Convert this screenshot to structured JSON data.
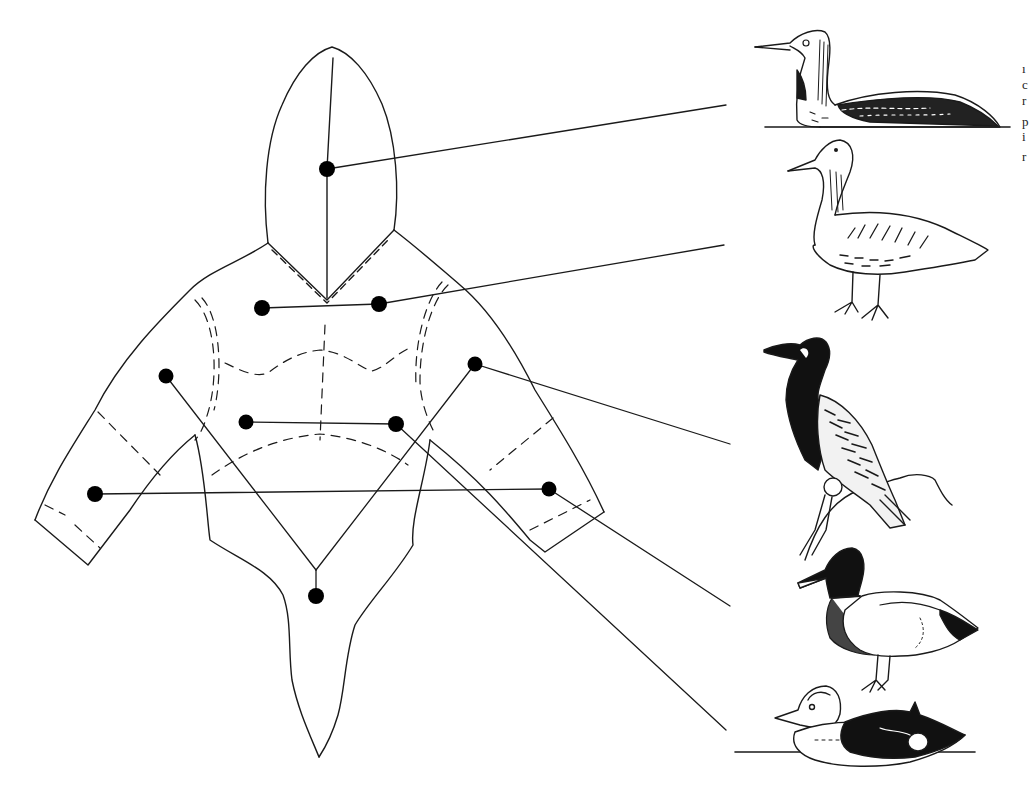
{
  "diagram": {
    "type": "garment-material-map",
    "line_color": "#1a1a1a",
    "dot_color": "#000000",
    "background": "#ffffff",
    "garment_parts": [
      {
        "id": "hood",
        "label": "hood",
        "dots": [
          [
            327,
            169
          ]
        ]
      },
      {
        "id": "upper-chest",
        "label": "upper chest (yoke)",
        "dots": [
          [
            262,
            308
          ],
          [
            379,
            304
          ]
        ]
      },
      {
        "id": "upper-arms",
        "label": "upper sleeves",
        "dots": [
          [
            166,
            376
          ],
          [
            475,
            364
          ]
        ]
      },
      {
        "id": "mid-chest",
        "label": "mid chest",
        "dots": [
          [
            246,
            422
          ],
          [
            396,
            424
          ]
        ]
      },
      {
        "id": "forearms",
        "label": "lower sleeves",
        "dots": [
          [
            95,
            494
          ],
          [
            549,
            489
          ]
        ]
      },
      {
        "id": "lower-body",
        "label": "lower body / tail flap",
        "dots": [
          [
            316,
            596
          ]
        ]
      }
    ],
    "birds": [
      {
        "id": "bird-1",
        "name": "loon (red-throated type)",
        "position": "top",
        "connects_to": "hood"
      },
      {
        "id": "bird-2",
        "name": "goose",
        "position": "second",
        "connects_to": "upper-chest"
      },
      {
        "id": "bird-3",
        "name": "cormorant",
        "position": "third",
        "connects_to": "upper-arms"
      },
      {
        "id": "bird-4",
        "name": "mallard drake",
        "position": "fourth",
        "connects_to": "forearms"
      },
      {
        "id": "bird-5",
        "name": "sea duck (eider-type) on water",
        "position": "bottom",
        "connects_to": "mid-chest"
      }
    ],
    "edge_text_fragments": [
      "ı",
      "c",
      "r",
      "p",
      "i",
      "r"
    ]
  }
}
